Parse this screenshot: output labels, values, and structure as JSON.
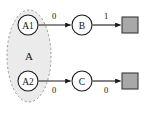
{
  "diagram": {
    "type": "state-transition-diagram",
    "background_color": "#ffffff",
    "group": {
      "label": "A",
      "style": "dashed-ellipse",
      "fill_color": "#e8e8e8",
      "stroke_color": "#9a9a9a",
      "members": [
        "A1",
        "A2"
      ]
    },
    "nodes": [
      {
        "id": "A1",
        "label": "A1",
        "shape": "circle",
        "x": 28,
        "y": 25,
        "r": 10
      },
      {
        "id": "A2",
        "label": "A2",
        "shape": "circle",
        "x": 28,
        "y": 81,
        "r": 10
      },
      {
        "id": "B",
        "label": "B",
        "shape": "circle",
        "x": 82,
        "y": 25,
        "r": 10
      },
      {
        "id": "C",
        "label": "C",
        "shape": "circle",
        "x": 82,
        "y": 81,
        "r": 10
      },
      {
        "id": "T1",
        "label": "",
        "shape": "square",
        "x": 130,
        "y": 25,
        "size": 16,
        "fill": "#a8a8a8"
      },
      {
        "id": "T2",
        "label": "",
        "shape": "square",
        "x": 130,
        "y": 81,
        "size": 16,
        "fill": "#a8a8a8"
      }
    ],
    "edges": [
      {
        "from": "A1",
        "to": "B",
        "label": "0",
        "label_position": "above"
      },
      {
        "from": "B",
        "to": "T1",
        "label": "1",
        "label_position": "above"
      },
      {
        "from": "A2",
        "to": "C",
        "label": "0",
        "label_position": "below"
      },
      {
        "from": "C",
        "to": "T2",
        "label": "0",
        "label_position": "below"
      }
    ]
  }
}
